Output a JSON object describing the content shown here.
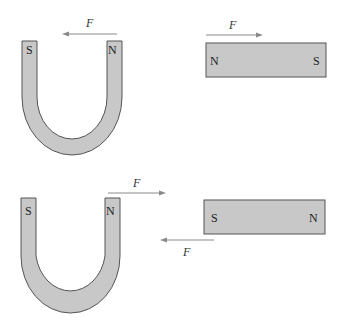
{
  "diagram": {
    "panels": [
      {
        "id": "top",
        "horseshoe": {
          "left_pole": "S",
          "right_pole": "N"
        },
        "bar": {
          "left_pole": "N",
          "right_pole": "S"
        },
        "forces": [
          {
            "label": "F",
            "on": "horseshoe",
            "direction": "left"
          },
          {
            "label": "F",
            "on": "bar",
            "direction": "right"
          }
        ]
      },
      {
        "id": "bottom",
        "horseshoe": {
          "left_pole": "S",
          "right_pole": "N"
        },
        "bar": {
          "left_pole": "S",
          "right_pole": "N"
        },
        "forces": [
          {
            "label": "F",
            "on": "horseshoe",
            "direction": "right"
          },
          {
            "label": "F",
            "on": "bar",
            "direction": "left"
          }
        ]
      }
    ],
    "colors": {
      "magnet_fill": "#c8c8c8",
      "magnet_stroke": "#555555",
      "arrow": "#8a8a8a"
    }
  }
}
